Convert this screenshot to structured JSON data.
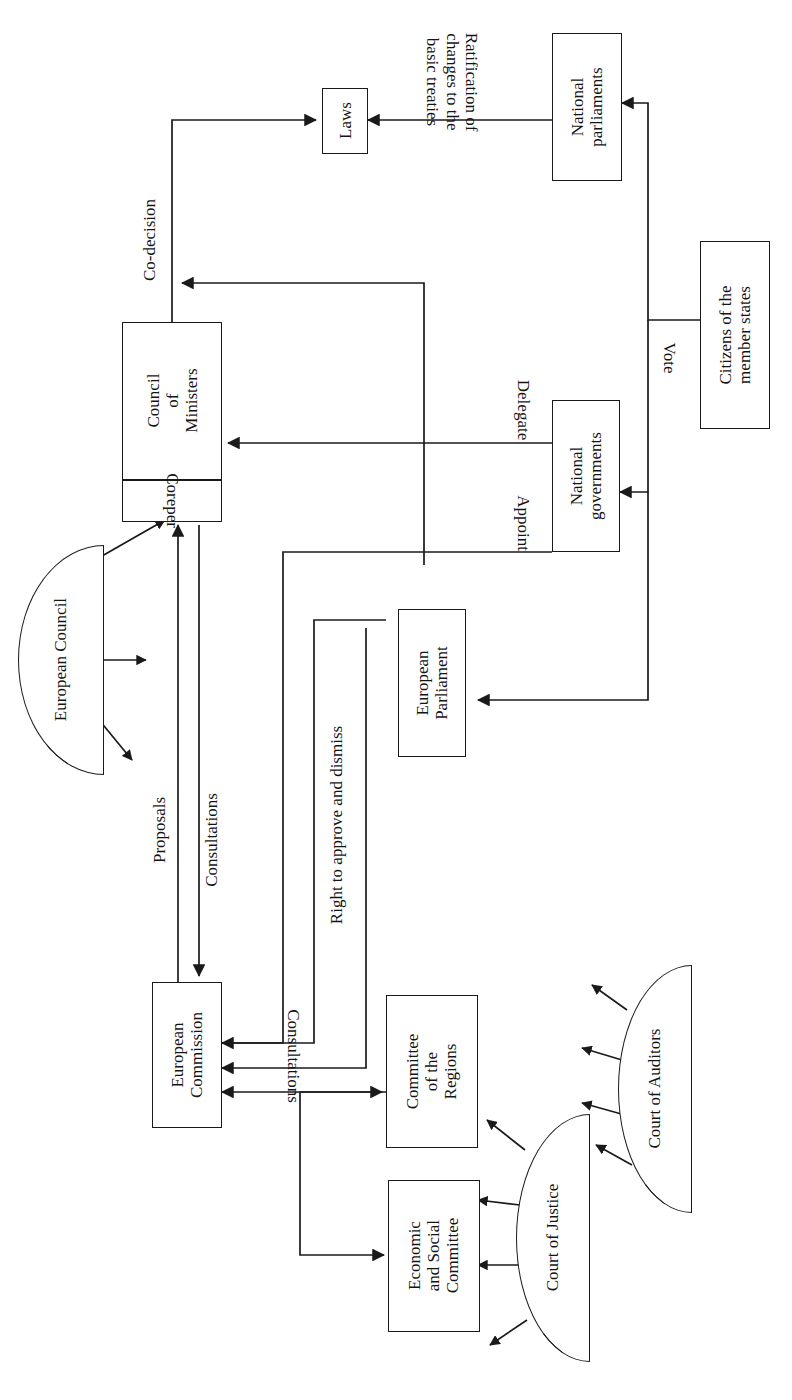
{
  "diagram": {
    "orientation": "rotated-90-ccw",
    "line_color": "#1a1a1a",
    "text_color": "#141414",
    "background": "#ffffff"
  },
  "nodes": {
    "laws": {
      "label": "Laws",
      "shape": "rect"
    },
    "national_parliaments": {
      "label": "National\nparliaments",
      "line1": "National",
      "line2": "parliaments",
      "shape": "rect"
    },
    "council_of_ministers": {
      "line1": "Council",
      "line2": "of",
      "line3": "Ministers",
      "shape": "rect"
    },
    "coreper": {
      "label": "Coreper",
      "shape": "rect-sub"
    },
    "european_council": {
      "label": "European Council",
      "shape": "half-ellipse"
    },
    "national_governments": {
      "line1": "National",
      "line2": "governments",
      "shape": "rect"
    },
    "citizens": {
      "line1": "Citizens of the",
      "line2": "member states",
      "shape": "rect"
    },
    "european_parliament": {
      "line1": "European",
      "line2": "Parliament",
      "shape": "rect"
    },
    "european_commission": {
      "line1": "European",
      "line2": "Commission",
      "shape": "rect"
    },
    "committee_of_regions": {
      "line1": "Committee",
      "line2": "of the",
      "line3": "Regions",
      "shape": "rect"
    },
    "economic_social_committee": {
      "line1": "Economic",
      "line2": "and Social",
      "line3": "Committee",
      "shape": "rect"
    },
    "court_of_justice": {
      "label": "Court of Justice",
      "shape": "half-ellipse"
    },
    "court_of_auditors": {
      "label": "Court of Auditors",
      "shape": "half-ellipse"
    }
  },
  "edge_labels": {
    "ratification": {
      "line1": "Ratification of",
      "line2": "changes to the",
      "line3": "basic treaties"
    },
    "co_decision": "Co-decision",
    "vote": "Vote",
    "delegate": "Delegate",
    "appoint": "Appoint",
    "proposals": "Proposals",
    "consultations_council": "Consultations",
    "right_to_approve": "Right to approve and dismiss",
    "consultations_committees": "Consultations"
  }
}
